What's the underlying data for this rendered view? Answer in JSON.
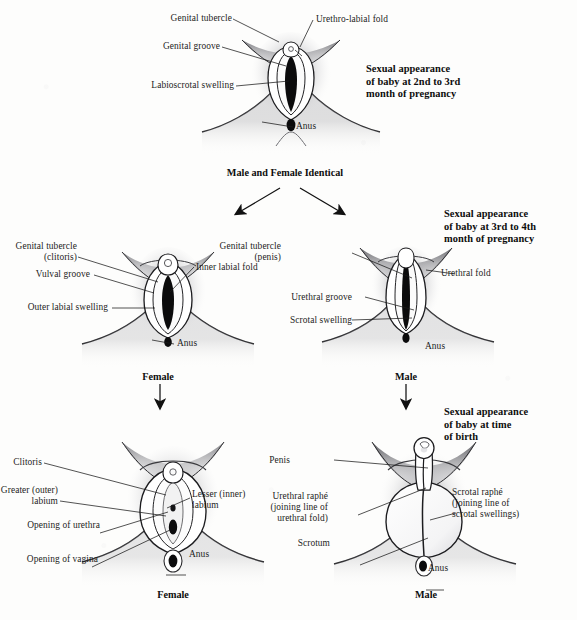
{
  "figure": {
    "type": "anatomical-diagram",
    "panels": [
      {
        "id": "indifferent",
        "stage_heading": "Sexual appearance\nof baby at 2nd to 3rd\nmonth of pregnancy",
        "sex_label": "",
        "labels": [
          "Genital tubercle",
          "Genital groove",
          "Labioscrotal swelling",
          "Urethro-labial fold",
          "Anus"
        ]
      },
      {
        "id": "female-mid",
        "stage_heading": "",
        "sex_label": "Female",
        "labels": [
          "Genital tubercle\n(clitoris)",
          "Vulval groove",
          "Outer labial swelling",
          "Inner labial fold",
          "Anus"
        ]
      },
      {
        "id": "male-mid",
        "stage_heading": "Sexual appearance\nof baby at 3rd to 4th\nmonth of pregnancy",
        "sex_label": "Male",
        "labels": [
          "Genital tubercle\n(penis)",
          "Urethral groove",
          "Scrotal swelling",
          "Urethral fold",
          "Anus"
        ]
      },
      {
        "id": "female-birth",
        "stage_heading": "",
        "sex_label": "Female",
        "labels": [
          "Clitoris",
          "Greater (outer)\nlabium",
          "Opening of urethra",
          "Opening of vagina",
          "Lesser (inner)\nlabium",
          "Anus"
        ]
      },
      {
        "id": "male-birth",
        "stage_heading": "Sexual appearance\nof baby at time\nof birth",
        "sex_label": "Male",
        "labels": [
          "Penis",
          "Urethral raphé\n(joining line of\nurethral fold)",
          "Scrotum",
          "Scrotal raphé\n(joining line of\nscrotal swellings)",
          "Anus"
        ]
      }
    ]
  },
  "divider_text": "Male and Female Identical",
  "stage_headings": {
    "month2to3": "Sexual appearance\nof baby at 2nd to 3rd\nmonth of pregnancy",
    "month3to4": "Sexual appearance\nof baby at 3rd to 4th\nmonth of pregnancy",
    "birth": "Sexual appearance\nof baby at time\nof birth"
  },
  "panel_top": {
    "label_genital_tubercle": "Genital tubercle",
    "label_genital_groove": "Genital groove",
    "label_labioscrotal_swelling": "Labioscrotal swelling",
    "label_urethro_labial_fold": "Urethro-labial fold",
    "label_anus": "Anus"
  },
  "panel_female_mid": {
    "label_genital_tubercle": "Genital tubercle",
    "label_genital_tubercle_sub": "(clitoris)",
    "label_vulval_groove": "Vulval groove",
    "label_outer_labial_swelling": "Outer labial swelling",
    "label_inner_labial_fold": "Inner labial fold",
    "label_anus": "Anus",
    "sex": "Female"
  },
  "panel_male_mid": {
    "label_genital_tubercle": "Genital tubercle",
    "label_genital_tubercle_sub": "(penis)",
    "label_urethral_groove": "Urethral groove",
    "label_scrotal_swelling": "Scrotal swelling",
    "label_urethral_fold": "Urethral fold",
    "label_anus": "Anus",
    "sex": "Male"
  },
  "panel_female_birth": {
    "label_clitoris": "Clitoris",
    "label_greater_labium_l1": "Greater (outer)",
    "label_greater_labium_l2": "labium",
    "label_opening_urethra": "Opening of urethra",
    "label_opening_vagina": "Opening of vagina",
    "label_lesser_labium_l1": "Lesser (inner)",
    "label_lesser_labium_l2": "labium",
    "label_anus": "Anus",
    "sex": "Female"
  },
  "panel_male_birth": {
    "label_penis": "Penis",
    "label_urethral_raphe_l1": "Urethral raphé",
    "label_urethral_raphe_l2": "(joining line of",
    "label_urethral_raphe_l3": "urethral fold)",
    "label_scrotum": "Scrotum",
    "label_scrotal_raphe_l1": "Scrotal raphé",
    "label_scrotal_raphe_l2": "(joining line of",
    "label_scrotal_raphe_l3": "scrotal swellings)",
    "label_anus": "Anus",
    "sex": "Male"
  },
  "colors": {
    "ink": "#1a1a1a",
    "paper": "#fdfdfc",
    "shade_dark": "#3c3c3f",
    "shade_mid": "#8c8c90",
    "shade_light": "#c9c9cc"
  }
}
